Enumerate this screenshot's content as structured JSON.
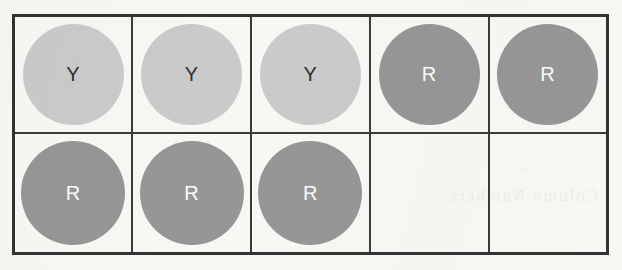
{
  "board": {
    "title": "Connect Four token grid",
    "rows": 2,
    "columns": 5,
    "colors": {
      "page_background": "#f8f7f4",
      "grid_line": "#3a3a3a",
      "outer_border": "#323232",
      "yellow_token_fill": "#cacaca",
      "yellow_token_text": "#2f2f2f",
      "red_token_fill": "#969696",
      "red_token_text": "#fbfbfb"
    },
    "legend": {
      "yellow_label": "Y",
      "red_label": "R",
      "empty_label": ""
    },
    "cells": [
      [
        {
          "label": "Y",
          "kind": "yellow"
        },
        {
          "label": "Y",
          "kind": "yellow"
        },
        {
          "label": "Y",
          "kind": "yellow"
        },
        {
          "label": "R",
          "kind": "red"
        },
        {
          "label": "R",
          "kind": "red"
        }
      ],
      [
        {
          "label": "R",
          "kind": "red"
        },
        {
          "label": "R",
          "kind": "red"
        },
        {
          "label": "R",
          "kind": "red"
        },
        {
          "label": "",
          "kind": "empty"
        },
        {
          "label": "",
          "kind": "empty"
        }
      ]
    ]
  },
  "artifacts": {
    "bleed_through_text": "Column Numbers"
  }
}
